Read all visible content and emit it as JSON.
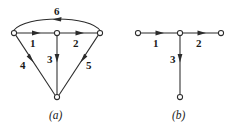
{
  "figure": {
    "background_color": "#ffffff",
    "ink_color": "#2b2b2b",
    "graphs": [
      {
        "id": "graph-a",
        "caption": "(a)",
        "caption_pos": {
          "x": 49,
          "y": 110
        },
        "nodes": [
          {
            "id": "a-left",
            "x": 14,
            "y": 33
          },
          {
            "id": "a-center",
            "x": 57,
            "y": 33
          },
          {
            "id": "a-right",
            "x": 100,
            "y": 33
          },
          {
            "id": "a-bottom",
            "x": 57,
            "y": 97
          }
        ],
        "node_radius": 2.6,
        "edges": [
          {
            "id": "a-edge-1",
            "label": "1",
            "from": "a-left",
            "to": "a-center",
            "label_pos": {
              "x": 30,
              "y": 38
            }
          },
          {
            "id": "a-edge-2",
            "label": "2",
            "from": "a-center",
            "to": "a-right",
            "label_pos": {
              "x": 73,
              "y": 38
            }
          },
          {
            "id": "a-edge-3",
            "label": "3",
            "from": "a-center",
            "to": "a-bottom",
            "label_pos": {
              "x": 47,
              "y": 54
            }
          },
          {
            "id": "a-edge-4",
            "label": "4",
            "from": "a-left",
            "to": "a-bottom",
            "label_pos": {
              "x": 20,
              "y": 60
            }
          },
          {
            "id": "a-edge-5",
            "label": "5",
            "from": "a-right",
            "to": "a-bottom",
            "label_pos": {
              "x": 86,
              "y": 60
            }
          },
          {
            "id": "a-edge-6",
            "label": "6",
            "from": "a-right",
            "to": "a-left",
            "curved": true,
            "label_pos": {
              "x": 54,
              "y": 6
            }
          }
        ]
      },
      {
        "id": "graph-b",
        "caption": "(b)",
        "caption_pos": {
          "x": 172,
          "y": 110
        },
        "nodes": [
          {
            "id": "b-left",
            "x": 138,
            "y": 33
          },
          {
            "id": "b-center",
            "x": 180,
            "y": 33
          },
          {
            "id": "b-right",
            "x": 221,
            "y": 33
          },
          {
            "id": "b-bottom",
            "x": 180,
            "y": 97
          }
        ],
        "node_radius": 2.6,
        "edges": [
          {
            "id": "b-edge-1",
            "label": "1",
            "from": "b-left",
            "to": "b-center",
            "label_pos": {
              "x": 153,
              "y": 38
            }
          },
          {
            "id": "b-edge-2",
            "label": "2",
            "from": "b-center",
            "to": "b-right",
            "label_pos": {
              "x": 196,
              "y": 38
            }
          },
          {
            "id": "b-edge-3",
            "label": "3",
            "from": "b-center",
            "to": "b-bottom",
            "label_pos": {
              "x": 170,
              "y": 54
            }
          }
        ]
      }
    ]
  }
}
